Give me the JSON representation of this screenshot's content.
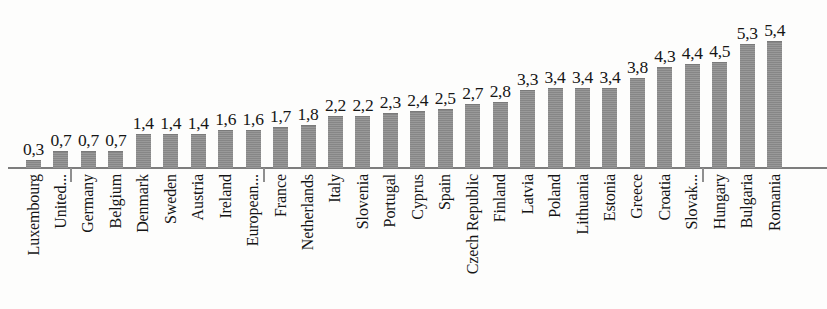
{
  "chart_data": {
    "type": "bar",
    "title": "",
    "subtitle": "",
    "xlabel": "",
    "ylabel": "",
    "grid": false,
    "legend": false,
    "legend_position": "none",
    "axis_range_y": [
      0,
      5.4
    ],
    "value_decimal_separator": ",",
    "bar_color": "#8d8d8d",
    "axis_color": "#7d7d7d",
    "text_color": "#161616",
    "categories": [
      "Luxembourg",
      "United...",
      "Germany",
      "Belgium",
      "Denmark",
      "Sweden",
      "Austria",
      "Ireland",
      "European...",
      "France",
      "Netherlands",
      "Italy",
      "Slovenia",
      "Portugal",
      "Cyprus",
      "Spain",
      "Czech Republic",
      "Finland",
      "Latvia",
      "Poland",
      "Lithuania",
      "Estonia",
      "Greece",
      "Croatia",
      "Slovak...",
      "Hungary",
      "Bulgaria",
      "Romania"
    ],
    "values": [
      0.3,
      0.7,
      0.7,
      0.7,
      1.4,
      1.4,
      1.4,
      1.6,
      1.6,
      1.7,
      1.8,
      2.2,
      2.2,
      2.3,
      2.4,
      2.5,
      2.7,
      2.8,
      3.3,
      3.4,
      3.4,
      3.4,
      3.8,
      4.3,
      4.4,
      4.5,
      5.3,
      5.4
    ],
    "value_labels": [
      "0,3",
      "0,7",
      "0,7",
      "0,7",
      "1,4",
      "1,4",
      "1,4",
      "1,6",
      "1,6",
      "1,7",
      "1,8",
      "2,2",
      "2,2",
      "2,3",
      "2,4",
      "2,5",
      "2,7",
      "2,8",
      "3,3",
      "3,4",
      "3,4",
      "3,4",
      "3,8",
      "4,3",
      "4,4",
      "4,5",
      "5,3",
      "5,4"
    ]
  }
}
